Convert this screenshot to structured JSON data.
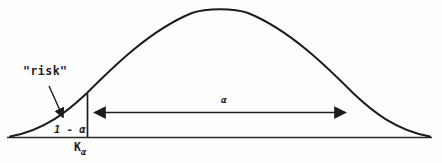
{
  "figure": {
    "colors": {
      "background": "#fefefe",
      "ink": "#1c1c1c"
    },
    "labels": {
      "risk": "\"risk\"",
      "tail_area": "1 - α",
      "critical_value_base": "K",
      "critical_value_sub": "α",
      "span_area": "α"
    }
  }
}
